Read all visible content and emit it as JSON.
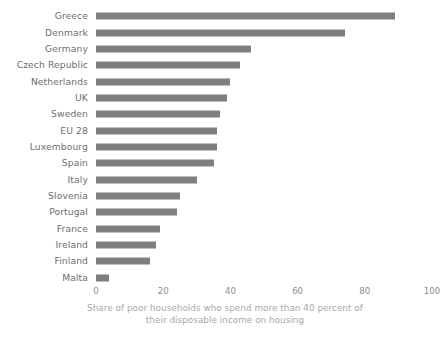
{
  "chart_data": {
    "type": "bar",
    "orientation": "horizontal",
    "title": "",
    "subtitle": "",
    "xlabel": "Share of poor households who spend more than 40 percent of their disposable income on housing",
    "ylabel": "",
    "xlim": [
      0,
      100
    ],
    "xticks": [
      0,
      20,
      40,
      60,
      80,
      100
    ],
    "xtick_labels": [
      "0",
      "20",
      "40",
      "60",
      "80",
      "100"
    ],
    "grid": false,
    "legend": null,
    "bar_color": "#7f7f7f",
    "label_color": "#6e6e6e",
    "tick_color": "#8c8c8c",
    "caption_color": "#a8a8a8",
    "background": "#ffffff",
    "categories": [
      "Greece",
      "Denmark",
      "Germany",
      "Czech Republic",
      "Netherlands",
      "UK",
      "Sweden",
      "EU 28",
      "Luxembourg",
      "Spain",
      "Italy",
      "Slovenia",
      "Portugal",
      "France",
      "Ireland",
      "Finland",
      "Malta"
    ],
    "values": [
      89,
      74,
      46,
      43,
      40,
      39,
      37,
      36,
      36,
      35,
      30,
      25,
      24,
      19,
      18,
      16,
      4
    ]
  },
  "caption": {
    "line1": "Share of poor households who spend more than 40 percent of",
    "line2": "their disposable income on housing"
  }
}
